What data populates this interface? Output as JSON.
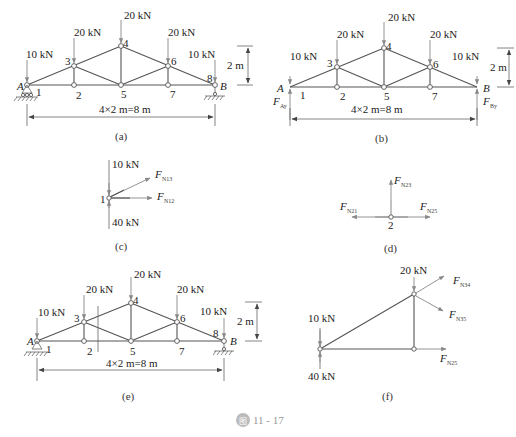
{
  "figure": {
    "caption_icon": "图",
    "caption_number": "11 - 17"
  },
  "panel_a": {
    "label": "(a)",
    "loads": {
      "load_A": "10 kN",
      "load_3": "20 kN",
      "load_4": "20 kN",
      "load_6": "20 kN",
      "load_B": "10 kN"
    },
    "nodes": {
      "n1": "1",
      "n2": "2",
      "n3": "3",
      "n4": "4",
      "n5": "5",
      "n6": "6",
      "n7": "7",
      "n8": "8"
    },
    "supports": {
      "left": "A",
      "right": "B"
    },
    "height_dim": "2 m",
    "span_dim": "4×2 m=8 m"
  },
  "panel_b": {
    "label": "(b)",
    "loads": {
      "load_A": "10 kN",
      "load_3": "20 kN",
      "load_4": "20 kN",
      "load_6": "20 kN",
      "load_B": "10 kN"
    },
    "nodes": {
      "n1": "1",
      "n2": "2",
      "n3": "3",
      "n4": "4",
      "n5": "5",
      "n6": "6",
      "n7": "7"
    },
    "supports": {
      "left": "A",
      "right": "B"
    },
    "reactions": {
      "left_main": "F",
      "left_sub": "Ay",
      "right_main": "F",
      "right_sub": "By"
    },
    "height_dim": "2 m",
    "span_dim": "4×2 m=8 m"
  },
  "panel_c": {
    "label": "(c)",
    "node": "1",
    "load_down": "10 kN",
    "load_up": "40 kN",
    "forces": {
      "f13_main": "F",
      "f13_sub": "N13",
      "f12_main": "F",
      "f12_sub": "N12"
    }
  },
  "panel_d": {
    "label": "(d)",
    "node": "2",
    "forces": {
      "f23_main": "F",
      "f23_sub": "N23",
      "f21_main": "F",
      "f21_sub": "N21",
      "f25_main": "F",
      "f25_sub": "N25"
    }
  },
  "panel_e": {
    "label": "(e)",
    "loads": {
      "load_A": "10 kN",
      "load_3": "20 kN",
      "load_4": "20 kN",
      "load_6": "20 kN",
      "load_B": "10 kN"
    },
    "nodes": {
      "n1": "1",
      "n2": "2",
      "n3": "3",
      "n4": "4",
      "n5": "5",
      "n6": "6",
      "n7": "7",
      "n8": "8"
    },
    "supports": {
      "left": "A",
      "right": "B"
    },
    "height_dim": "2 m",
    "span_dim": "4×2 m=8 m"
  },
  "panel_f": {
    "label": "(f)",
    "load_top": "20 kN",
    "load_down": "10 kN",
    "load_up": "40 kN",
    "forces": {
      "f34_main": "F",
      "f34_sub": "N34",
      "f35_main": "F",
      "f35_sub": "N35",
      "f25_main": "F",
      "f25_sub": "N25"
    }
  }
}
